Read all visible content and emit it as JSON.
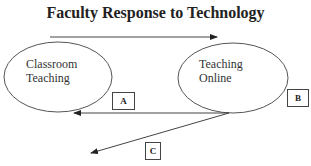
{
  "title": "Faculty Response to Technology",
  "nodes": {
    "left": {
      "line1": "Classroom",
      "line2": "Teaching"
    },
    "right": {
      "line1": "Teaching",
      "line2": "Online"
    }
  },
  "boxes": {
    "a": "A",
    "b": "B",
    "c": "C"
  }
}
